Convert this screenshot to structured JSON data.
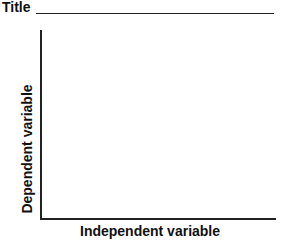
{
  "chart_data": {
    "type": "line",
    "title": "Title",
    "xlabel": "Independent variable",
    "ylabel": "Dependent variable",
    "series": [],
    "grid": false,
    "legend": null
  }
}
